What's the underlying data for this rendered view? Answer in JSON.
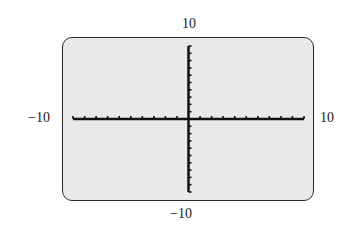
{
  "chart_data": {
    "type": "line",
    "title": "",
    "xlabel": "",
    "ylabel": "",
    "xlim": [
      -10,
      10
    ],
    "ylim": [
      -10,
      10
    ],
    "xscale": 1,
    "yscale": 1,
    "grid": false,
    "series": [],
    "window_labels": {
      "xmin": "−10",
      "xmax": "10",
      "ymin": "−10",
      "ymax": "10"
    },
    "screen_color": "#e9e9e9",
    "axis_color": "#111111"
  }
}
